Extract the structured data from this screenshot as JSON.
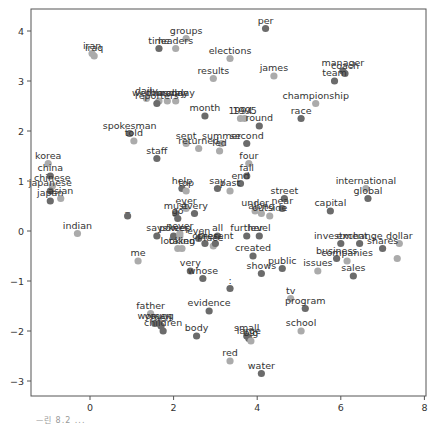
{
  "chart_data": {
    "type": "scatter",
    "title": "",
    "xlabel": "",
    "ylabel": "",
    "xlim": [
      -1.4,
      8.05
    ],
    "ylim": [
      -3.3,
      4.45
    ],
    "xticks": [
      0,
      2,
      4,
      6,
      8
    ],
    "yticks": [
      -3,
      -2,
      -1,
      0,
      1,
      2,
      3,
      4
    ],
    "grid": false,
    "legend": null,
    "point_colors": {
      "dark": "#6b6b6b",
      "light": "#ababab"
    },
    "points": [
      {
        "label": "per",
        "x": 4.2,
        "y": 4.05,
        "shade": "dark"
      },
      {
        "label": "groups",
        "x": 2.3,
        "y": 3.85,
        "shade": "light"
      },
      {
        "label": "leaders",
        "x": 2.05,
        "y": 3.65,
        "shade": "light"
      },
      {
        "label": "time",
        "x": 1.65,
        "y": 3.65,
        "shade": "dark"
      },
      {
        "label": "iran",
        "x": 0.05,
        "y": 3.55,
        "shade": "light"
      },
      {
        "label": "iraq",
        "x": 0.1,
        "y": 3.5,
        "shade": "light"
      },
      {
        "label": "elections",
        "x": 3.35,
        "y": 3.45,
        "shade": "light"
      },
      {
        "label": "results",
        "x": 2.95,
        "y": 3.05,
        "shade": "light"
      },
      {
        "label": "james",
        "x": 4.4,
        "y": 3.1,
        "shade": "light"
      },
      {
        "label": "manager",
        "x": 6.05,
        "y": 3.2,
        "shade": "dark"
      },
      {
        "label": "coach",
        "x": 6.1,
        "y": 3.15,
        "shade": "dark"
      },
      {
        "label": "team",
        "x": 5.85,
        "y": 3.0,
        "shade": "dark"
      },
      {
        "label": "daily",
        "x": 1.35,
        "y": 2.65,
        "shade": "light"
      },
      {
        "label": "wednesday",
        "x": 1.65,
        "y": 2.6,
        "shade": "light"
      },
      {
        "label": "thursday",
        "x": 1.85,
        "y": 2.6,
        "shade": "light"
      },
      {
        "label": "monday",
        "x": 2.05,
        "y": 2.6,
        "shade": "light"
      },
      {
        "label": "reporters",
        "x": 1.6,
        "y": 2.55,
        "shade": "dark"
      },
      {
        "label": "championship",
        "x": 5.4,
        "y": 2.55,
        "shade": "light"
      },
      {
        "label": "month",
        "x": 2.75,
        "y": 2.3,
        "shade": "dark"
      },
      {
        "label": "1994",
        "x": 3.6,
        "y": 2.25,
        "shade": "light"
      },
      {
        "label": "1995",
        "x": 3.7,
        "y": 2.25,
        "shade": "light"
      },
      {
        "label": "race",
        "x": 5.05,
        "y": 2.25,
        "shade": "dark"
      },
      {
        "label": "round",
        "x": 4.05,
        "y": 2.1,
        "shade": "dark"
      },
      {
        "label": "spokesman",
        "x": 0.95,
        "y": 1.95,
        "shade": "dark"
      },
      {
        "label": "told",
        "x": 1.05,
        "y": 1.8,
        "shade": "light"
      },
      {
        "label": "sent",
        "x": 2.3,
        "y": 1.75,
        "shade": "light"
      },
      {
        "label": "returned",
        "x": 2.6,
        "y": 1.65,
        "shade": "light"
      },
      {
        "label": "summer",
        "x": 3.15,
        "y": 1.75,
        "shade": "light"
      },
      {
        "label": "led",
        "x": 3.1,
        "y": 1.6,
        "shade": "light"
      },
      {
        "label": "second",
        "x": 3.75,
        "y": 1.75,
        "shade": "dark"
      },
      {
        "label": "staff",
        "x": 1.6,
        "y": 1.45,
        "shade": "dark"
      },
      {
        "label": "korea",
        "x": -1.0,
        "y": 1.35,
        "shade": "light"
      },
      {
        "label": "four",
        "x": 3.8,
        "y": 1.35,
        "shade": "light"
      },
      {
        "label": "china",
        "x": -0.95,
        "y": 1.1,
        "shade": "dark"
      },
      {
        "label": "fall",
        "x": 3.75,
        "y": 1.1,
        "shade": "dark"
      },
      {
        "label": "end",
        "x": 3.6,
        "y": 0.95,
        "shade": "dark"
      },
      {
        "label": "chinese",
        "x": -0.9,
        "y": 0.9,
        "shade": "light"
      },
      {
        "label": "japanese",
        "x": -0.95,
        "y": 0.8,
        "shade": "dark"
      },
      {
        "label": "asian",
        "x": -0.7,
        "y": 0.65,
        "shade": "light"
      },
      {
        "label": "japan",
        "x": -0.95,
        "y": 0.6,
        "shade": "dark"
      },
      {
        "label": "international",
        "x": 6.6,
        "y": 0.85,
        "shade": "light"
      },
      {
        "label": "global",
        "x": 6.65,
        "y": 0.65,
        "shade": "dark"
      },
      {
        "label": "help",
        "x": 2.2,
        "y": 0.85,
        "shade": "dark"
      },
      {
        "label": "top",
        "x": 2.3,
        "y": 0.8,
        "shade": "light"
      },
      {
        "label": "say",
        "x": 3.05,
        "y": 0.85,
        "shade": "dark"
      },
      {
        "label": "past",
        "x": 3.35,
        "y": 0.8,
        "shade": "light"
      },
      {
        "label": "street",
        "x": 4.65,
        "y": 0.65,
        "shade": "dark"
      },
      {
        "label": "near",
        "x": 4.6,
        "y": 0.45,
        "shade": "dark"
      },
      {
        "label": "capital",
        "x": 5.75,
        "y": 0.4,
        "shade": "dark"
      },
      {
        "label": "_",
        "x": 0.9,
        "y": 0.3,
        "shade": "dark"
      },
      {
        "label": "ever",
        "x": 2.3,
        "y": 0.45,
        "shade": "light"
      },
      {
        "label": "every",
        "x": 2.5,
        "y": 0.35,
        "shade": "dark"
      },
      {
        "label": "must",
        "x": 2.05,
        "y": 0.35,
        "shade": "dark"
      },
      {
        "label": "go",
        "x": 2.1,
        "y": 0.25,
        "shade": "dark"
      },
      {
        "label": "under",
        "x": 3.95,
        "y": 0.4,
        "shade": "light"
      },
      {
        "label": "along",
        "x": 4.1,
        "y": 0.35,
        "shade": "light"
      },
      {
        "label": "outside",
        "x": 4.3,
        "y": 0.3,
        "shade": "light"
      },
      {
        "label": "indian",
        "x": -0.3,
        "y": -0.05,
        "shade": "light"
      },
      {
        "label": "says",
        "x": 1.6,
        "y": -0.1,
        "shade": "dark"
      },
      {
        "label": "power",
        "x": 2.0,
        "y": -0.1,
        "shade": "dark"
      },
      {
        "label": "never",
        "x": 2.15,
        "y": -0.05,
        "shade": "light"
      },
      {
        "label": "keep",
        "x": 2.15,
        "y": -0.1,
        "shade": "light"
      },
      {
        "label": "even",
        "x": 2.6,
        "y": -0.15,
        "shade": "dark"
      },
      {
        "label": "all",
        "x": 3.05,
        "y": -0.1,
        "shade": "dark"
      },
      {
        "label": "further",
        "x": 3.75,
        "y": -0.1,
        "shade": "dark"
      },
      {
        "label": "level",
        "x": 4.05,
        "y": -0.1,
        "shade": "dark"
      },
      {
        "label": "other",
        "x": 2.75,
        "y": -0.25,
        "shade": "dark"
      },
      {
        "label": "face",
        "x": 2.95,
        "y": -0.3,
        "shade": "light"
      },
      {
        "label": "present",
        "x": 3.0,
        "y": -0.25,
        "shade": "dark"
      },
      {
        "label": "looking",
        "x": 2.1,
        "y": -0.35,
        "shade": "light"
      },
      {
        "label": "taken",
        "x": 2.2,
        "y": -0.35,
        "shade": "light"
      },
      {
        "label": "created",
        "x": 3.9,
        "y": -0.5,
        "shade": "dark"
      },
      {
        "label": "investment",
        "x": 6.0,
        "y": -0.25,
        "shade": "dark"
      },
      {
        "label": "exchange",
        "x": 6.45,
        "y": -0.25,
        "shade": "dark"
      },
      {
        "label": "dollar",
        "x": 7.4,
        "y": -0.25,
        "shade": "light"
      },
      {
        "label": "shares",
        "x": 7.0,
        "y": -0.35,
        "shade": "dark"
      },
      {
        "label": "business",
        "x": 5.9,
        "y": -0.55,
        "shade": "dark"
      },
      {
        "label": "companies",
        "x": 6.15,
        "y": -0.6,
        "shade": "light"
      },
      {
        "label": "me",
        "x": 1.15,
        "y": -0.6,
        "shade": "light"
      },
      {
        "label": "very",
        "x": 2.4,
        "y": -0.8,
        "shade": "dark"
      },
      {
        "label": "whose",
        "x": 2.7,
        "y": -0.95,
        "shade": "dark"
      },
      {
        "label": "shows",
        "x": 4.1,
        "y": -0.85,
        "shade": "dark"
      },
      {
        "label": "public",
        "x": 4.6,
        "y": -0.75,
        "shade": "dark"
      },
      {
        "label": "issues",
        "x": 5.45,
        "y": -0.8,
        "shade": "light"
      },
      {
        "label": "sales",
        "x": 6.3,
        "y": -0.9,
        "shade": "dark"
      },
      {
        "label": "shares_2",
        "x": 7.35,
        "y": -0.55,
        "shade": "light"
      },
      {
        "label": ":",
        "x": 3.35,
        "y": -1.15,
        "shade": "dark"
      },
      {
        "label": "tv",
        "x": 4.8,
        "y": -1.35,
        "shade": "light"
      },
      {
        "label": "program",
        "x": 5.15,
        "y": -1.55,
        "shade": "dark"
      },
      {
        "label": "father",
        "x": 1.45,
        "y": -1.65,
        "shade": "light"
      },
      {
        "label": "evidence",
        "x": 2.85,
        "y": -1.6,
        "shade": "dark"
      },
      {
        "label": "women",
        "x": 1.55,
        "y": -1.85,
        "shade": "dark"
      },
      {
        "label": "young",
        "x": 1.65,
        "y": -1.85,
        "shade": "dark"
      },
      {
        "label": "men",
        "x": 1.7,
        "y": -1.9,
        "shade": "dark"
      },
      {
        "label": "children",
        "x": 1.75,
        "y": -2.0,
        "shade": "dark"
      },
      {
        "label": "school",
        "x": 5.05,
        "y": -2.0,
        "shade": "light"
      },
      {
        "label": "body",
        "x": 2.55,
        "y": -2.1,
        "shade": "dark"
      },
      {
        "label": "small",
        "x": 3.75,
        "y": -2.1,
        "shade": "dark"
      },
      {
        "label": "large",
        "x": 3.8,
        "y": -2.15,
        "shade": "dark"
      },
      {
        "label": "big",
        "x": 3.85,
        "y": -2.2,
        "shade": "light"
      },
      {
        "label": "red",
        "x": 3.35,
        "y": -2.6,
        "shade": "light"
      },
      {
        "label": "water",
        "x": 4.1,
        "y": -2.85,
        "shade": "dark"
      }
    ]
  },
  "caption": "ᅳ린 8.2 ..."
}
